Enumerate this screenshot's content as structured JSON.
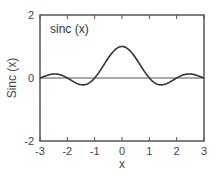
{
  "chart_data": {
    "type": "line",
    "title": "",
    "legend": [
      "sinc (x)"
    ],
    "xlabel": "x",
    "ylabel": "Sinc (x)",
    "xlim": [
      -3,
      3
    ],
    "ylim": [
      -2,
      2
    ],
    "xticks": [
      -3,
      -2,
      -1,
      0,
      1,
      2,
      3
    ],
    "yticks": [
      -2,
      0,
      2
    ],
    "xtick_labels": [
      "-3",
      "-2",
      "-1",
      "0",
      "1",
      "2",
      "3"
    ],
    "ytick_labels": [
      "-2",
      "0",
      "2"
    ],
    "grid": false,
    "zero_line": true,
    "series": [
      {
        "name": "sinc (x)",
        "function": "sin(pi*x)/(pi*x)",
        "x": [
          -3,
          -2.5,
          -2,
          -1.5,
          -1,
          -0.5,
          0,
          0.5,
          1,
          1.5,
          2,
          2.5,
          3
        ],
        "values": [
          0,
          0.127,
          0,
          -0.212,
          0,
          0.637,
          1,
          0.637,
          0,
          -0.212,
          0,
          0.127,
          0
        ]
      }
    ],
    "colors": {
      "line": "#333333",
      "axis": "#555555"
    }
  }
}
